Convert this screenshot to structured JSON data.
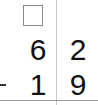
{
  "worksheet": {
    "operation": "subtraction",
    "borrow_box": {
      "value": ""
    },
    "minuend": {
      "tens": "6",
      "ones": "2"
    },
    "subtrahend": {
      "tens": "1",
      "ones": "9"
    },
    "operator_symbol": "−"
  }
}
